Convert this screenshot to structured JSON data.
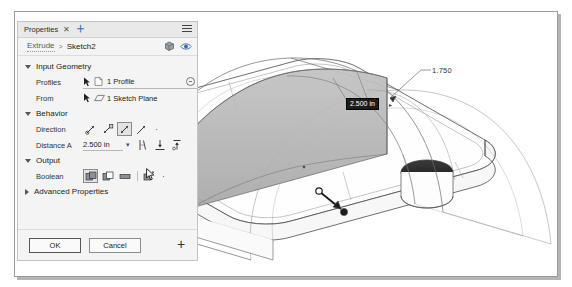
{
  "document": {
    "cutoff_text": "the tool and a Distance value of 2.500 for the extrusion distance as show"
  },
  "panel": {
    "tab": {
      "label": "Properties",
      "close_icon": "close-icon",
      "add_icon": "add-tab-icon",
      "menu_icon": "hamburger-menu-icon"
    },
    "breadcrumb": {
      "parent": "Extrude",
      "separator": ">",
      "current": "Sketch2",
      "icon_solid": "solid-body-icon",
      "icon_eye": "visibility-eye-icon"
    },
    "sections": {
      "input_geometry": {
        "title": "Input Geometry",
        "expanded": true,
        "profiles": {
          "label": "Profiles",
          "value": "1 Profile",
          "pick_icon": "select-arrow-icon",
          "type_icon": "profile-icon",
          "clear_icon": "clear-selection-icon"
        },
        "from": {
          "label": "From",
          "value": "1 Sketch Plane",
          "pick_icon": "select-arrow-icon",
          "type_icon": "sketch-plane-icon"
        }
      },
      "behavior": {
        "title": "Behavior",
        "expanded": true,
        "direction": {
          "label": "Direction",
          "options": [
            "direction-one-side-icon",
            "direction-flipped-icon",
            "direction-symmetric-icon",
            "direction-two-sides-icon"
          ],
          "selected_index": 2,
          "more_label": "·"
        },
        "distance_a": {
          "label": "Distance A",
          "value": "2.500 in",
          "dropdown_caret": "▾",
          "extent_icons": [
            "taper-angle-icon",
            "to-object-icon",
            "to-all-icon"
          ]
        }
      },
      "output": {
        "title": "Output",
        "expanded": true,
        "boolean": {
          "label": "Boolean",
          "options": [
            "boolean-join-icon",
            "boolean-cut-icon",
            "boolean-intersect-icon",
            "boolean-new-body-icon"
          ],
          "selected_index": 0,
          "more_label": "·"
        }
      },
      "advanced": {
        "title": "Advanced Properties",
        "expanded": false
      }
    },
    "footer": {
      "ok_label": "OK",
      "cancel_label": "Cancel",
      "plus_label": "+"
    }
  },
  "viewport": {
    "dimension_static": "1.750",
    "dimension_active": "2.500 in",
    "dimension_active_caret": "▸",
    "manipulator": "drag-arrow-handle",
    "model": "slot-base-plate-with-two-holes-and-arch-extrude"
  },
  "colors": {
    "panel_bg": "#f4f4f4",
    "tab_bg": "#e9e9e9",
    "preview_fill": "#b3b3b3",
    "active_dim_bg": "#1c1c1c",
    "active_dim_fg": "#ffffff",
    "edge_line": "#4a4a4a"
  }
}
